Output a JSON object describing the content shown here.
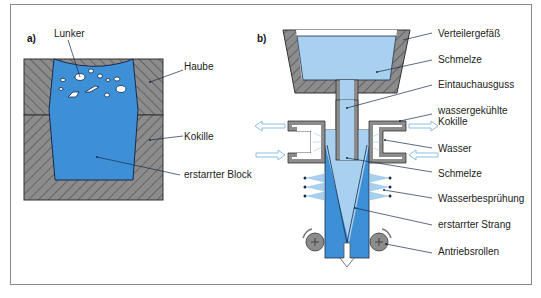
{
  "panels": {
    "a": {
      "label": "a)",
      "labels": {
        "lunker": "Lunker",
        "haube": "Haube",
        "kokille": "Kokille",
        "block": "erstarrter Block"
      }
    },
    "b": {
      "label": "b)",
      "labels": {
        "verteilergefaess": "Verteilergefäß",
        "schmelze_top": "Schmelze",
        "eintauchausguss": "Eintauchausguss",
        "kokille_line1": "wassergekühlte",
        "kokille_line2": "Kokille",
        "wasser": "Wasser",
        "schmelze_mid": "Schmelze",
        "bespruehung": "Wasserbesprühung",
        "strang": "erstarrter Strang",
        "rollen": "Antriebsrollen"
      }
    }
  },
  "colors": {
    "melt_dark": "#3d8fd6",
    "melt_light": "#a8d0ef",
    "mold_gray": "#8c8c8c",
    "outline": "#1a2a4a",
    "water_arrow": "#7fb8e0"
  }
}
